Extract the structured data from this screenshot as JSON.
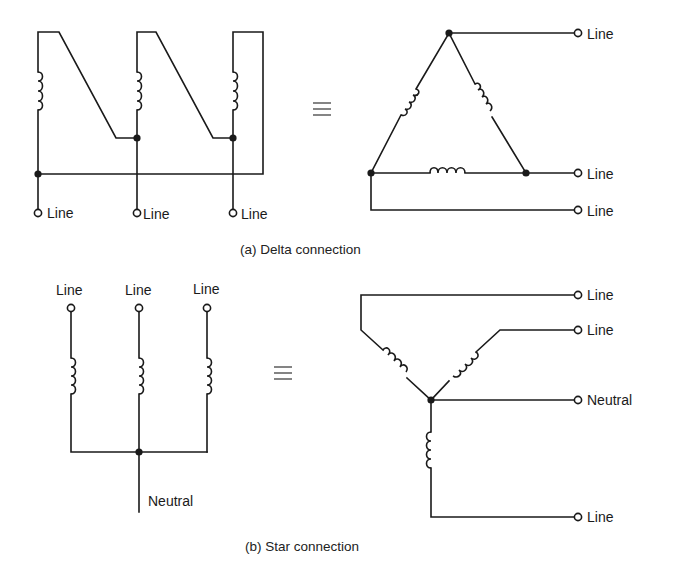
{
  "figure": {
    "delta": {
      "caption": "(a) Delta connection",
      "left_labels": [
        "Line",
        "Line",
        "Line"
      ],
      "right_labels": [
        "Line",
        "Line",
        "Line"
      ],
      "equivalence_symbol": "≡"
    },
    "star": {
      "caption": "(b) Star connection",
      "top_labels": [
        "Line",
        "Line",
        "Line"
      ],
      "neutral_label": "Neutral",
      "right_labels": [
        "Line",
        "Line",
        "Neutral",
        "Line"
      ],
      "equivalence_symbol": "≡"
    }
  },
  "colors": {
    "ink": "#1a1a1a",
    "background": "#ffffff"
  }
}
